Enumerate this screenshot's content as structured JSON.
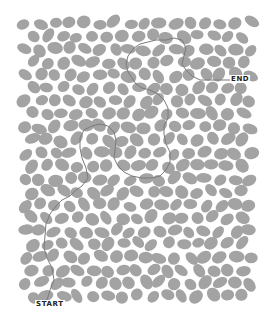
{
  "maze": {
    "labels": {
      "start": "START",
      "end": "END"
    },
    "colors": {
      "background": "#ffffff",
      "blob": "#a3a3a3",
      "path": "#7a7a7a",
      "label": "#222222"
    },
    "bounds": {
      "x": 20,
      "y": 18,
      "width": 238,
      "height": 282
    },
    "path_points": [
      [
        47,
        300
      ],
      [
        50,
        290
      ],
      [
        54,
        280
      ],
      [
        52,
        268
      ],
      [
        47,
        258
      ],
      [
        44,
        248
      ],
      [
        45,
        236
      ],
      [
        46,
        224
      ],
      [
        50,
        214
      ],
      [
        56,
        206
      ],
      [
        62,
        200
      ],
      [
        70,
        196
      ],
      [
        76,
        190
      ],
      [
        82,
        186
      ],
      [
        88,
        178
      ],
      [
        86,
        168
      ],
      [
        82,
        158
      ],
      [
        80,
        148
      ],
      [
        80,
        138
      ],
      [
        84,
        130
      ],
      [
        92,
        126
      ],
      [
        100,
        124
      ],
      [
        108,
        126
      ],
      [
        114,
        132
      ],
      [
        116,
        140
      ],
      [
        115,
        150
      ],
      [
        114,
        158
      ],
      [
        118,
        166
      ],
      [
        124,
        172
      ],
      [
        132,
        176
      ],
      [
        142,
        178
      ],
      [
        152,
        178
      ],
      [
        160,
        176
      ],
      [
        166,
        170
      ],
      [
        170,
        162
      ],
      [
        170,
        152
      ],
      [
        166,
        144
      ],
      [
        164,
        134
      ],
      [
        164,
        126
      ],
      [
        168,
        118
      ],
      [
        168,
        108
      ],
      [
        164,
        100
      ],
      [
        158,
        94
      ],
      [
        150,
        90
      ],
      [
        142,
        88
      ],
      [
        136,
        84
      ],
      [
        132,
        78
      ],
      [
        128,
        72
      ],
      [
        126,
        64
      ],
      [
        128,
        56
      ],
      [
        134,
        48
      ],
      [
        140,
        44
      ],
      [
        148,
        42
      ],
      [
        156,
        40
      ],
      [
        166,
        40
      ],
      [
        174,
        38
      ],
      [
        182,
        40
      ],
      [
        186,
        48
      ],
      [
        184,
        56
      ],
      [
        182,
        64
      ],
      [
        186,
        70
      ],
      [
        192,
        76
      ],
      [
        200,
        80
      ],
      [
        210,
        80
      ],
      [
        220,
        80
      ],
      [
        232,
        80
      ]
    ]
  }
}
